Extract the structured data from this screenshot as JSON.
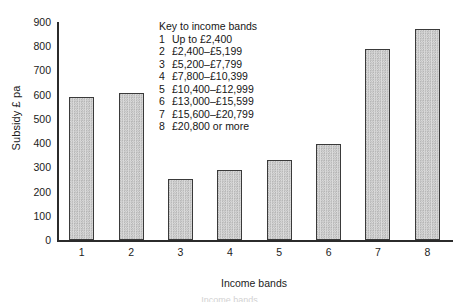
{
  "chart_data": {
    "type": "bar",
    "title": "",
    "xlabel": "Income bands",
    "ylabel": "Subsidy £ pa",
    "categories": [
      "1",
      "2",
      "3",
      "4",
      "5",
      "6",
      "7",
      "8"
    ],
    "values": [
      590,
      607,
      253,
      288,
      330,
      395,
      787,
      872
    ],
    "ylim": [
      0,
      900
    ],
    "yticks": [
      0,
      100,
      200,
      300,
      400,
      500,
      600,
      700,
      800,
      900
    ],
    "ytick_labels": [
      "0",
      "100",
      "200",
      "300",
      "400",
      "500",
      "600",
      "700",
      "800",
      "900"
    ],
    "grid": false,
    "legend_position": "inside-top-center",
    "bar_fill": "#c9c9c9",
    "bar_edge": "#3a3a3a",
    "axis_color": "#2b2b2b"
  },
  "key": {
    "title": "Key to income bands",
    "entries": [
      {
        "num": "1",
        "range": "Up to £2,400"
      },
      {
        "num": "2",
        "range": "£2,400–£5,199"
      },
      {
        "num": "3",
        "range": "£5,200–£7,799"
      },
      {
        "num": "4",
        "range": "£7,800–£10,399"
      },
      {
        "num": "5",
        "range": "£10,400–£12,999"
      },
      {
        "num": "6",
        "range": "£13,000–£15,599"
      },
      {
        "num": "7",
        "range": "£15,600–£20,799"
      },
      {
        "num": "8",
        "range": "£20,800 or more"
      }
    ]
  },
  "caption": "Income bands"
}
